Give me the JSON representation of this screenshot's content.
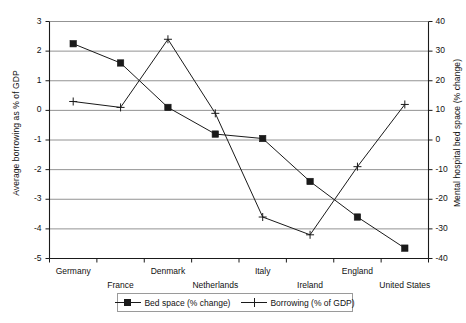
{
  "chart_data": {
    "type": "line",
    "title": "",
    "xlabel": "",
    "ylabel": "Average borrowing as % of GDP",
    "y2label": "Mental hospital bed space (% change)",
    "categories": [
      "Germany",
      "France",
      "Denmark",
      "Netherlands",
      "Italy",
      "Ireland",
      "England",
      "United States"
    ],
    "ylim": [
      -5,
      3
    ],
    "yticks": [
      "3",
      "2",
      "1",
      "0",
      "-1",
      "-2",
      "-3",
      "-4",
      "-5"
    ],
    "y2lim": [
      -40,
      40
    ],
    "y2ticks": [
      "40",
      "30",
      "20",
      "10",
      "0",
      "-10",
      "-20",
      "-30",
      "-40"
    ],
    "grid": true,
    "legend_position": "bottom",
    "series": [
      {
        "name": "Bed space (% change)",
        "axis": "right",
        "marker": "square",
        "color": "#1a1a1a",
        "values": [
          32.5,
          26,
          11,
          2,
          0.5,
          -14,
          -26,
          -36.5
        ],
        "left_axis_equivalent": [
          2.25,
          1.6,
          0.1,
          -0.8,
          -0.95,
          -2.4,
          -3.6,
          -4.65
        ]
      },
      {
        "name": "Borrowing (% of GDP)",
        "axis": "left",
        "marker": "plus",
        "color": "#1a1a1a",
        "values": [
          0.3,
          0.1,
          2.4,
          -0.1,
          -3.6,
          -4.2,
          -1.9,
          0.2
        ]
      }
    ]
  },
  "legend": {
    "entries": [
      {
        "label": "Bed space (% change)",
        "marker": "square"
      },
      {
        "label": "Borrowing (% of GDP)",
        "marker": "plus"
      }
    ]
  }
}
